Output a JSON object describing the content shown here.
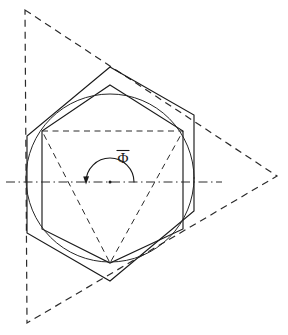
{
  "figure": {
    "canvas": {
      "width": 288,
      "height": 335,
      "background": "#ffffff"
    },
    "center": {
      "x": 110,
      "y": 182
    },
    "label": {
      "symbol": "Φ",
      "has_overbar": true,
      "name": "phi-bar-angle-label",
      "x": 123,
      "y": 163
    },
    "colors": {
      "line": "#1a1a1a",
      "dashed": "#2b2b2b",
      "background": "#ffffff"
    },
    "shapes": [
      {
        "name": "outer-dashed-triangle",
        "kind": "polygon",
        "style": "dashed",
        "points": "25,10 277,176 27,323"
      },
      {
        "name": "outer-solid-hexagon",
        "kind": "polygon",
        "style": "solid",
        "points": "110,67 194,115 194,211 110,281 27,233 27,136"
      },
      {
        "name": "inner-solid-hexagon",
        "kind": "polygon",
        "style": "solid",
        "points": "110,85 183,131 183,229 110,263 42,229 42,131"
      },
      {
        "name": "inscribed-circle",
        "kind": "circle",
        "style": "solid",
        "cx": 110,
        "cy": 178,
        "r": 84
      },
      {
        "name": "inner-dashed-triangle",
        "kind": "polygon",
        "style": "dashed-fine",
        "points": "42,131 183,131 110,263"
      },
      {
        "name": "horizontal-center-axis",
        "kind": "line",
        "style": "dashdot",
        "x1": 6,
        "y1": 182,
        "x2": 222,
        "y2": 182
      }
    ],
    "angle_arc": {
      "name": "phi-bar-angle-arc",
      "cx": 110,
      "cy": 182,
      "r": 24,
      "start_deg": 180,
      "end_deg": 0,
      "direction": "counterclockwise",
      "arrow_at": "left-end"
    }
  }
}
